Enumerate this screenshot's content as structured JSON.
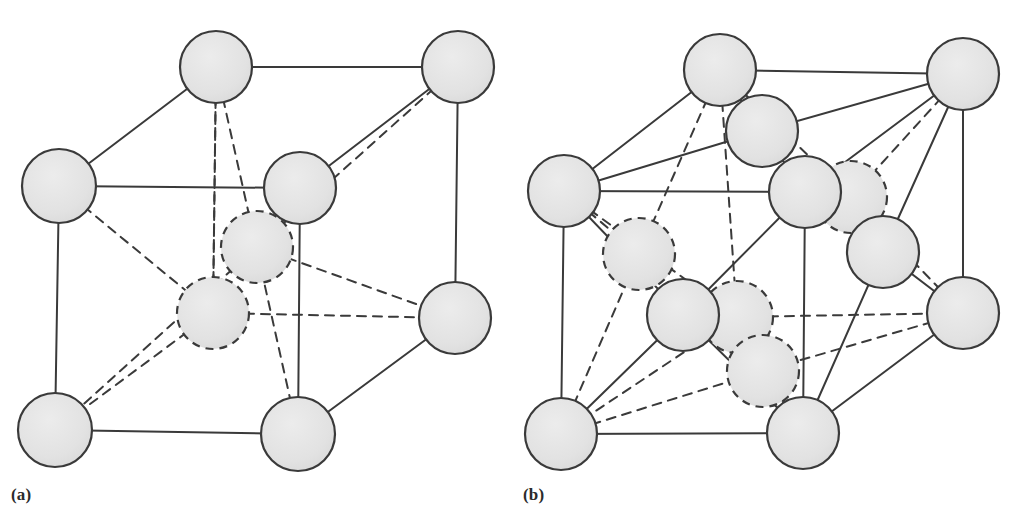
{
  "figure": {
    "background_color": "#ffffff",
    "atom_fill_color": "#e3e3e3",
    "atom_stroke_color": "#3a3a3a",
    "bond_color": "#3a3a3a",
    "hidden_bond_style": "dashed",
    "visible_bond_style": "solid",
    "atom_radius": 36,
    "stroke_width": 2
  },
  "panels": [
    {
      "id": "a",
      "label": "(a)",
      "structure_type": "body-centered cubic",
      "atom_count_drawn": 10,
      "atoms": [
        {
          "name": "corner-top-back-left",
          "cx": 216,
          "cy": 67,
          "r": 36,
          "hidden": false
        },
        {
          "name": "corner-top-back-right",
          "cx": 458,
          "cy": 67,
          "r": 36,
          "hidden": false
        },
        {
          "name": "corner-top-front-left",
          "cx": 59,
          "cy": 186,
          "r": 37,
          "hidden": false
        },
        {
          "name": "corner-top-front-right",
          "cx": 300,
          "cy": 188,
          "r": 36,
          "hidden": false
        },
        {
          "name": "center-upper",
          "cx": 257,
          "cy": 247,
          "r": 36,
          "hidden": true
        },
        {
          "name": "center-lower",
          "cx": 213,
          "cy": 313,
          "r": 36,
          "hidden": true
        },
        {
          "name": "corner-bottom-back-right",
          "cx": 455,
          "cy": 318,
          "r": 36,
          "hidden": false
        },
        {
          "name": "corner-bottom-front-left",
          "cx": 55,
          "cy": 430,
          "r": 37,
          "hidden": false
        },
        {
          "name": "corner-bottom-front-right",
          "cx": 298,
          "cy": 434,
          "r": 37,
          "hidden": false
        }
      ],
      "bonds_solid": [
        {
          "name": "edge-top-back",
          "x1": 216,
          "y1": 67,
          "x2": 458,
          "y2": 67
        },
        {
          "name": "edge-top-left-diag",
          "x1": 216,
          "y1": 67,
          "x2": 59,
          "y2": 186
        },
        {
          "name": "edge-top-right-diag",
          "x1": 458,
          "y1": 67,
          "x2": 300,
          "y2": 188
        },
        {
          "name": "edge-top-front",
          "x1": 59,
          "y1": 186,
          "x2": 300,
          "y2": 188
        },
        {
          "name": "edge-left-vertical",
          "x1": 59,
          "y1": 186,
          "x2": 55,
          "y2": 430
        },
        {
          "name": "edge-front-vertical",
          "x1": 300,
          "y1": 188,
          "x2": 298,
          "y2": 434
        },
        {
          "name": "edge-right-vertical",
          "x1": 458,
          "y1": 67,
          "x2": 455,
          "y2": 318
        },
        {
          "name": "edge-bottom-front",
          "x1": 55,
          "y1": 430,
          "x2": 298,
          "y2": 434
        },
        {
          "name": "edge-bottom-right-diag",
          "x1": 298,
          "y1": 434,
          "x2": 455,
          "y2": 318
        }
      ],
      "bonds_dashed": [
        {
          "name": "hidden-edge-back-left",
          "x1": 59,
          "y1": 186,
          "x2": 213,
          "y2": 313
        },
        {
          "name": "hidden-edge-back-top",
          "x1": 216,
          "y1": 67,
          "x2": 213,
          "y2": 313
        },
        {
          "name": "hidden-edge-back-vert",
          "x1": 213,
          "y1": 313,
          "x2": 216,
          "y2": 67
        },
        {
          "name": "hidden-edge-back-right",
          "x1": 213,
          "y1": 313,
          "x2": 455,
          "y2": 318
        },
        {
          "name": "hidden-edge-back-bottom",
          "x1": 213,
          "y1": 313,
          "x2": 55,
          "y2": 430
        },
        {
          "name": "body-diag-upper-left",
          "x1": 216,
          "y1": 67,
          "x2": 298,
          "y2": 434
        },
        {
          "name": "body-diag-upper-right",
          "x1": 458,
          "y1": 67,
          "x2": 257,
          "y2": 247
        },
        {
          "name": "body-diag-to-right",
          "x1": 257,
          "y1": 247,
          "x2": 455,
          "y2": 318
        },
        {
          "name": "body-diag-to-bottom-left",
          "x1": 257,
          "y1": 247,
          "x2": 55,
          "y2": 430
        }
      ]
    },
    {
      "id": "b",
      "label": "(b)",
      "structure_type": "face-centered cubic",
      "atom_count_drawn": 14,
      "atoms": [
        {
          "name": "corner-top-back-left",
          "cx": 720,
          "cy": 70,
          "r": 36,
          "hidden": false
        },
        {
          "name": "corner-top-back-right",
          "cx": 963,
          "cy": 74,
          "r": 36,
          "hidden": false
        },
        {
          "name": "face-center-top",
          "cx": 762,
          "cy": 131,
          "r": 36,
          "hidden": false
        },
        {
          "name": "corner-top-front-left",
          "cx": 564,
          "cy": 191,
          "r": 36,
          "hidden": false
        },
        {
          "name": "corner-top-front-right",
          "cx": 805,
          "cy": 192,
          "r": 36,
          "hidden": false
        },
        {
          "name": "face-center-back",
          "cx": 851,
          "cy": 197,
          "r": 36,
          "hidden": true
        },
        {
          "name": "face-center-left",
          "cx": 639,
          "cy": 254,
          "r": 36,
          "hidden": true
        },
        {
          "name": "face-center-right",
          "cx": 883,
          "cy": 252,
          "r": 36,
          "hidden": false
        },
        {
          "name": "face-center-front",
          "cx": 683,
          "cy": 315,
          "r": 36,
          "hidden": false
        },
        {
          "name": "face-center-interior",
          "cx": 737,
          "cy": 317,
          "r": 36,
          "hidden": true
        },
        {
          "name": "corner-bottom-back-right",
          "cx": 963,
          "cy": 313,
          "r": 36,
          "hidden": false
        },
        {
          "name": "face-center-bottom",
          "cx": 763,
          "cy": 371,
          "r": 36,
          "hidden": true
        },
        {
          "name": "corner-bottom-front-left",
          "cx": 561,
          "cy": 434,
          "r": 36,
          "hidden": false
        },
        {
          "name": "corner-bottom-front-right",
          "cx": 803,
          "cy": 433,
          "r": 36,
          "hidden": false
        }
      ],
      "bonds_solid": [
        {
          "name": "edge-top-back",
          "x1": 720,
          "y1": 70,
          "x2": 963,
          "y2": 74
        },
        {
          "name": "edge-top-left-diag",
          "x1": 720,
          "y1": 70,
          "x2": 564,
          "y2": 191
        },
        {
          "name": "edge-top-right-diag",
          "x1": 963,
          "y1": 74,
          "x2": 805,
          "y2": 192
        },
        {
          "name": "edge-top-front",
          "x1": 564,
          "y1": 191,
          "x2": 805,
          "y2": 192
        },
        {
          "name": "edge-left-vertical",
          "x1": 564,
          "y1": 191,
          "x2": 561,
          "y2": 434
        },
        {
          "name": "edge-front-vertical",
          "x1": 805,
          "y1": 192,
          "x2": 803,
          "y2": 433
        },
        {
          "name": "edge-right-vertical",
          "x1": 963,
          "y1": 74,
          "x2": 963,
          "y2": 313
        },
        {
          "name": "edge-bottom-front",
          "x1": 561,
          "y1": 434,
          "x2": 803,
          "y2": 433
        },
        {
          "name": "edge-bottom-right-diag",
          "x1": 803,
          "y1": 433,
          "x2": 963,
          "y2": 313
        },
        {
          "name": "bond-topface-to-corner-tl",
          "x1": 720,
          "y1": 70,
          "x2": 762,
          "y2": 131
        },
        {
          "name": "bond-topface-to-corner-br",
          "x1": 963,
          "y1": 74,
          "x2": 762,
          "y2": 131
        },
        {
          "name": "bond-topface-to-corner-fl",
          "x1": 564,
          "y1": 191,
          "x2": 762,
          "y2": 131
        },
        {
          "name": "bond-topface-to-corner-fr",
          "x1": 805,
          "y1": 192,
          "x2": 762,
          "y2": 131
        },
        {
          "name": "bond-rightface-to-tr",
          "x1": 963,
          "y1": 74,
          "x2": 883,
          "y2": 252
        },
        {
          "name": "bond-rightface-to-fr",
          "x1": 805,
          "y1": 192,
          "x2": 883,
          "y2": 252
        },
        {
          "name": "bond-rightface-to-br",
          "x1": 963,
          "y1": 313,
          "x2": 883,
          "y2": 252
        },
        {
          "name": "bond-rightface-to-bfr",
          "x1": 803,
          "y1": 433,
          "x2": 883,
          "y2": 252
        },
        {
          "name": "bond-frontface-to-tfl",
          "x1": 564,
          "y1": 191,
          "x2": 683,
          "y2": 315
        },
        {
          "name": "bond-frontface-to-tfr",
          "x1": 805,
          "y1": 192,
          "x2": 683,
          "y2": 315
        },
        {
          "name": "bond-frontface-to-bfl",
          "x1": 561,
          "y1": 434,
          "x2": 683,
          "y2": 315
        },
        {
          "name": "bond-frontface-to-bfr",
          "x1": 803,
          "y1": 433,
          "x2": 683,
          "y2": 315
        }
      ],
      "bonds_dashed": [
        {
          "name": "hidden-edge-back-vert",
          "x1": 720,
          "y1": 70,
          "x2": 737,
          "y2": 317
        },
        {
          "name": "hidden-edge-back-left",
          "x1": 564,
          "y1": 191,
          "x2": 737,
          "y2": 317
        },
        {
          "name": "hidden-edge-back-right",
          "x1": 737,
          "y1": 317,
          "x2": 963,
          "y2": 313
        },
        {
          "name": "hidden-edge-back-bottom",
          "x1": 737,
          "y1": 317,
          "x2": 561,
          "y2": 434
        },
        {
          "name": "hidden-bond-backface-tl",
          "x1": 720,
          "y1": 70,
          "x2": 851,
          "y2": 197
        },
        {
          "name": "hidden-bond-backface-tr",
          "x1": 963,
          "y1": 74,
          "x2": 851,
          "y2": 197
        },
        {
          "name": "hidden-bond-backface-br",
          "x1": 963,
          "y1": 313,
          "x2": 851,
          "y2": 197
        },
        {
          "name": "hidden-bond-leftface-tl",
          "x1": 720,
          "y1": 70,
          "x2": 639,
          "y2": 254
        },
        {
          "name": "hidden-bond-leftface-tfl",
          "x1": 564,
          "y1": 191,
          "x2": 639,
          "y2": 254
        },
        {
          "name": "hidden-bond-leftface-bfl",
          "x1": 561,
          "y1": 434,
          "x2": 639,
          "y2": 254
        },
        {
          "name": "hidden-bond-bottomface-bfl",
          "x1": 561,
          "y1": 434,
          "x2": 763,
          "y2": 371
        },
        {
          "name": "hidden-bond-bottomface-bfr",
          "x1": 803,
          "y1": 433,
          "x2": 763,
          "y2": 371
        },
        {
          "name": "hidden-bond-bottomface-br",
          "x1": 963,
          "y1": 313,
          "x2": 763,
          "y2": 371
        },
        {
          "name": "hidden-bond-bottomface-back",
          "x1": 737,
          "y1": 317,
          "x2": 763,
          "y2": 371
        }
      ]
    }
  ]
}
